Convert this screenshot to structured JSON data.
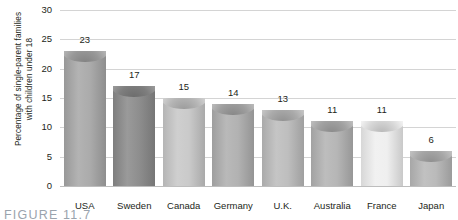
{
  "chart_data": {
    "type": "bar",
    "title": "",
    "xlabel": "",
    "ylabel": "Percentage of single-parent families with children under 18",
    "ylabel_line1": "Percentage of single-parent families",
    "ylabel_line2": "with children under 18",
    "categories": [
      "USA",
      "Sweden",
      "Canada",
      "Germany",
      "U.K.",
      "Australia",
      "France",
      "Japan"
    ],
    "values": [
      23,
      17,
      15,
      14,
      13,
      11,
      11,
      6
    ],
    "value_labels": [
      "23",
      "17",
      "15",
      "14",
      "13",
      "11",
      "11",
      "6"
    ],
    "bar_colors": [
      "#a9a9a9",
      "#8c8c8c",
      "#c9c9c9",
      "#b0b0b0",
      "#bdbdbd",
      "#b4b4b4",
      "#efefef",
      "#b9b9b9"
    ],
    "ylim": [
      0,
      30
    ],
    "yticks": [
      0,
      5,
      10,
      15,
      20,
      25,
      30
    ],
    "ytick_labels": [
      "0",
      "5",
      "10",
      "15",
      "20",
      "25",
      "30"
    ],
    "grid": true,
    "legend": "none",
    "gridline_color": "#d4d4d4",
    "axis_color": "#bdbdbd",
    "text_color": "#231f20"
  },
  "caption": {
    "text": "FIGURE 11.7"
  }
}
